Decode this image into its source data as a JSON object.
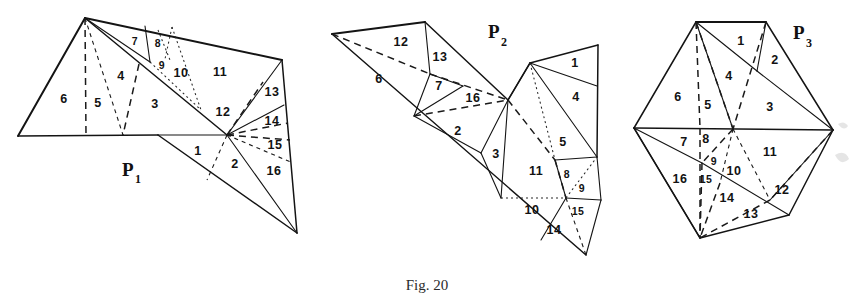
{
  "figure": {
    "caption": "Fig. 20",
    "background_color": "#ffffff",
    "ink_color": "#141414",
    "width": 855,
    "height": 294
  },
  "polygons": [
    {
      "id": "P1",
      "label": "P",
      "subscript": "1",
      "label_x": 122,
      "label_y": 172,
      "triangle_count": 16,
      "triangle_labels": [
        {
          "n": "6",
          "x": 64,
          "y": 100
        },
        {
          "n": "5",
          "x": 98,
          "y": 104
        },
        {
          "n": "4",
          "x": 121,
          "y": 77
        },
        {
          "n": "3",
          "x": 155,
          "y": 105
        },
        {
          "n": "7",
          "x": 135,
          "y": 42
        },
        {
          "n": "8",
          "x": 158,
          "y": 44
        },
        {
          "n": "9",
          "x": 162,
          "y": 66
        },
        {
          "n": "10",
          "x": 181,
          "y": 74
        },
        {
          "n": "11",
          "x": 220,
          "y": 73
        },
        {
          "n": "12",
          "x": 223,
          "y": 113
        },
        {
          "n": "13",
          "x": 272,
          "y": 93
        },
        {
          "n": "14",
          "x": 272,
          "y": 122
        },
        {
          "n": "15",
          "x": 275,
          "y": 146
        },
        {
          "n": "1",
          "x": 198,
          "y": 152
        },
        {
          "n": "2",
          "x": 235,
          "y": 165
        },
        {
          "n": "16",
          "x": 274,
          "y": 172
        }
      ]
    },
    {
      "id": "P2",
      "label": "P",
      "subscript": "2",
      "label_x": 490,
      "label_y": 34,
      "triangle_count": 16,
      "triangle_labels": [
        {
          "n": "12",
          "x": 401,
          "y": 43
        },
        {
          "n": "13",
          "x": 440,
          "y": 58
        },
        {
          "n": "6",
          "x": 379,
          "y": 80
        },
        {
          "n": "7",
          "x": 439,
          "y": 87
        },
        {
          "n": "16",
          "x": 473,
          "y": 99
        },
        {
          "n": "2",
          "x": 458,
          "y": 132
        },
        {
          "n": "3",
          "x": 496,
          "y": 155
        },
        {
          "n": "11",
          "x": 536,
          "y": 172
        },
        {
          "n": "1",
          "x": 575,
          "y": 64
        },
        {
          "n": "4",
          "x": 576,
          "y": 98
        },
        {
          "n": "5",
          "x": 563,
          "y": 143
        },
        {
          "n": "8",
          "x": 567,
          "y": 175
        },
        {
          "n": "9",
          "x": 580,
          "y": 188
        },
        {
          "n": "10",
          "x": 532,
          "y": 211
        },
        {
          "n": "15",
          "x": 578,
          "y": 212
        },
        {
          "n": "14",
          "x": 554,
          "y": 231
        }
      ]
    },
    {
      "id": "P3",
      "label": "P",
      "subscript": "3",
      "label_x": 797,
      "label_y": 38,
      "triangle_count": 16,
      "triangle_labels": [
        {
          "n": "1",
          "x": 741,
          "y": 42
        },
        {
          "n": "2",
          "x": 775,
          "y": 61
        },
        {
          "n": "4",
          "x": 729,
          "y": 77
        },
        {
          "n": "6",
          "x": 678,
          "y": 98
        },
        {
          "n": "5",
          "x": 708,
          "y": 106
        },
        {
          "n": "3",
          "x": 770,
          "y": 108
        },
        {
          "n": "7",
          "x": 684,
          "y": 143
        },
        {
          "n": "8",
          "x": 706,
          "y": 140
        },
        {
          "n": "9",
          "x": 714,
          "y": 162
        },
        {
          "n": "10",
          "x": 732,
          "y": 172
        },
        {
          "n": "11",
          "x": 770,
          "y": 153
        },
        {
          "n": "16",
          "x": 680,
          "y": 180
        },
        {
          "n": "15",
          "x": 706,
          "y": 180
        },
        {
          "n": "14",
          "x": 727,
          "y": 199
        },
        {
          "n": "12",
          "x": 782,
          "y": 191
        },
        {
          "n": "13",
          "x": 751,
          "y": 215
        }
      ]
    }
  ]
}
